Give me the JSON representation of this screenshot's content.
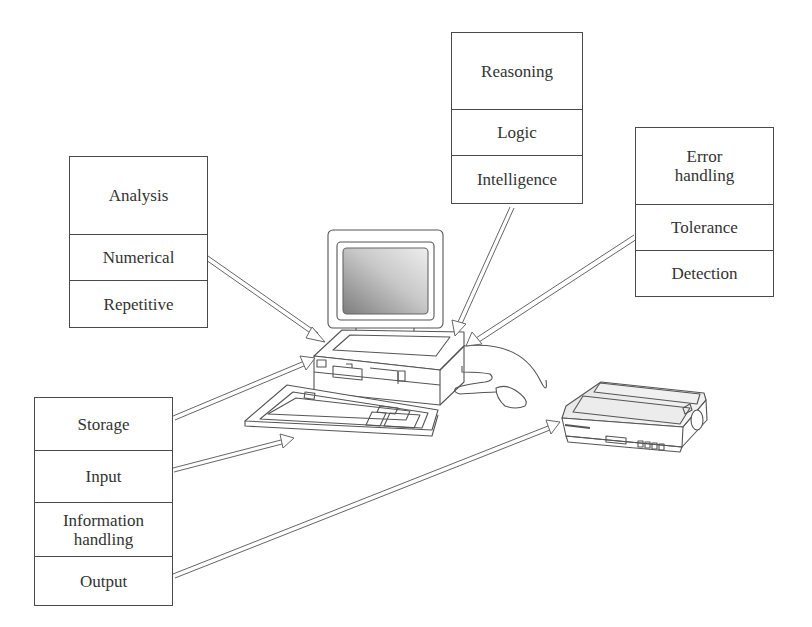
{
  "diagram": {
    "type": "computer-capabilities-illustration",
    "boxes": {
      "analysis": {
        "header": "Analysis",
        "items": [
          "Numerical",
          "Repetitive"
        ]
      },
      "reasoning": {
        "header": "Reasoning",
        "items": [
          "Logic",
          "Intelligence"
        ]
      },
      "error": {
        "header": "Error handling",
        "header_lines": [
          "Error",
          "handling"
        ],
        "items": [
          "Tolerance",
          "Detection"
        ]
      },
      "io": {
        "items": [
          "Storage",
          "Input",
          "Information handling",
          "Output"
        ],
        "info_lines": [
          "Information",
          "handling"
        ]
      }
    },
    "illustration": [
      "computer-monitor",
      "system-unit",
      "keyboard",
      "mouse",
      "dot-matrix-printer"
    ],
    "arrows": [
      {
        "from": "Analysis box",
        "to": "system-unit"
      },
      {
        "from": "Reasoning box",
        "to": "system-unit"
      },
      {
        "from": "Error handling box",
        "to": "system-unit"
      },
      {
        "from": "Storage",
        "to": "system-unit"
      },
      {
        "from": "Input",
        "to": "keyboard"
      },
      {
        "from": "Output",
        "to": "printer"
      }
    ],
    "colors": {
      "line": "#4a4a4a",
      "text": "#333333",
      "screen_dark": "#8a8a8a",
      "screen_light": "#e6e6e6",
      "background": "#ffffff"
    }
  }
}
